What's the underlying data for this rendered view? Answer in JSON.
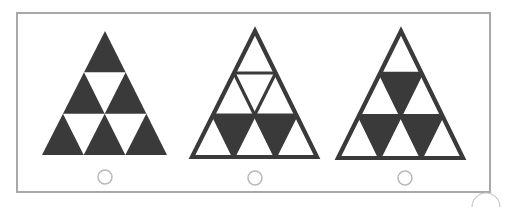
{
  "colors": {
    "dark_fill": "#3a3a3a",
    "outline": "#3a3a3a",
    "frame": "#a8a8a8",
    "radio_stroke": "#b8b8b8",
    "background": "#ffffff"
  },
  "options": [
    {
      "label": "option-1",
      "style": "solid",
      "apex": [
        105,
        31
      ],
      "base_left": [
        42,
        155
      ],
      "base_right": [
        167,
        155
      ],
      "filled_inverted": [],
      "radio": {
        "cx": 105,
        "cy": 177,
        "r": 7,
        "selected": false
      }
    },
    {
      "label": "option-2",
      "style": "outlined",
      "apex": [
        255,
        31
      ],
      "base_left": [
        192,
        157
      ],
      "base_right": [
        317,
        157
      ],
      "filled_inverted": [
        "bottom-left",
        "bottom-right"
      ],
      "radio": {
        "cx": 255,
        "cy": 178,
        "r": 7,
        "selected": false
      }
    },
    {
      "label": "option-3",
      "style": "outlined",
      "apex": [
        401,
        31
      ],
      "base_left": [
        338,
        158
      ],
      "base_right": [
        463,
        158
      ],
      "filled_inverted": [
        "top",
        "bottom-left",
        "bottom-right"
      ],
      "radio": {
        "cx": 405,
        "cy": 178,
        "r": 7,
        "selected": false
      }
    }
  ]
}
